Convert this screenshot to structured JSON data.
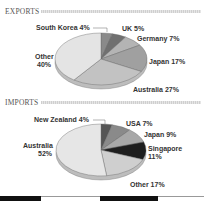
{
  "exports": {
    "title": "EXPORTS"
  },
  "imports": {
    "title": "IMPORTS"
  },
  "chart_data": [
    {
      "type": "pie",
      "title": "EXPORTS",
      "categories": [
        "South Korea",
        "UK",
        "Germany",
        "Japan",
        "Australia",
        "Other"
      ],
      "values": [
        4,
        5,
        7,
        17,
        27,
        40
      ],
      "labels": [
        "South Korea 4%",
        "UK 5%",
        "Germany 7%",
        "Japan 17%",
        "Australia 27%",
        "Other 40%"
      ],
      "colors": [
        "#8a8a8a",
        "#707070",
        "#b4b4b4",
        "#a0a0a0",
        "#c2c2c2",
        "#e4e4e4"
      ]
    },
    {
      "type": "pie",
      "title": "IMPORTS",
      "categories": [
        "New Zealand",
        "USA",
        "Japan",
        "Singapore",
        "Other",
        "Australia"
      ],
      "values": [
        4,
        7,
        9,
        11,
        17,
        52
      ],
      "labels": [
        "New Zealand 4%",
        "USA 7%",
        "Japan 9%",
        "Singapore 11%",
        "Other 17%",
        "Australia 52%"
      ],
      "colors": [
        "#555555",
        "#8a8a8a",
        "#a8a8a8",
        "#1e1e1e",
        "#cfcfcf",
        "#e6e6e6"
      ]
    }
  ],
  "labels": {
    "exp_southkorea": "South Korea 4%",
    "exp_uk": "UK 5%",
    "exp_germany": "Germany 7%",
    "exp_japan": "Japan 17%",
    "exp_australia": "Australia 27%",
    "exp_other_1": "Other",
    "exp_other_2": "40%",
    "imp_nz": "New Zealand 4%",
    "imp_usa": "USA 7%",
    "imp_japan": "Japan 9%",
    "imp_singapore_1": "Singapore",
    "imp_singapore_2": "11%",
    "imp_other": "Other 17%",
    "imp_australia_1": "Australia",
    "imp_australia_2": "52%"
  }
}
